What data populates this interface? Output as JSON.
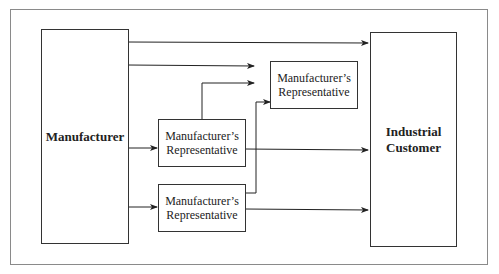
{
  "diagram": {
    "title": "",
    "nodes": {
      "manufacturer": {
        "label": "Manufacturer"
      },
      "customer": {
        "label_line1": "Industrial",
        "label_line2": "Customer"
      },
      "rep_top": {
        "label_line1": "Manufacturer’s",
        "label_line2": "Representative"
      },
      "rep_mid": {
        "label_line1": "Manufacturer’s",
        "label_line2": "Representative"
      },
      "rep_bottom": {
        "label_line1": "Manufacturer’s",
        "label_line2": "Representative"
      }
    },
    "edges": [
      {
        "from": "manufacturer",
        "to": "customer",
        "note": "direct channel"
      },
      {
        "from": "manufacturer",
        "to": "rep_top"
      },
      {
        "from": "manufacturer",
        "to": "rep_mid"
      },
      {
        "from": "manufacturer",
        "to": "rep_bottom"
      },
      {
        "from": "rep_mid",
        "to": "rep_top"
      },
      {
        "from": "rep_mid",
        "to": "customer"
      },
      {
        "from": "rep_bottom",
        "to": "rep_top"
      },
      {
        "from": "rep_bottom",
        "to": "customer"
      }
    ],
    "colors": {
      "line": "#222222",
      "frame": "#8a8a8a",
      "background": "#ffffff"
    }
  }
}
